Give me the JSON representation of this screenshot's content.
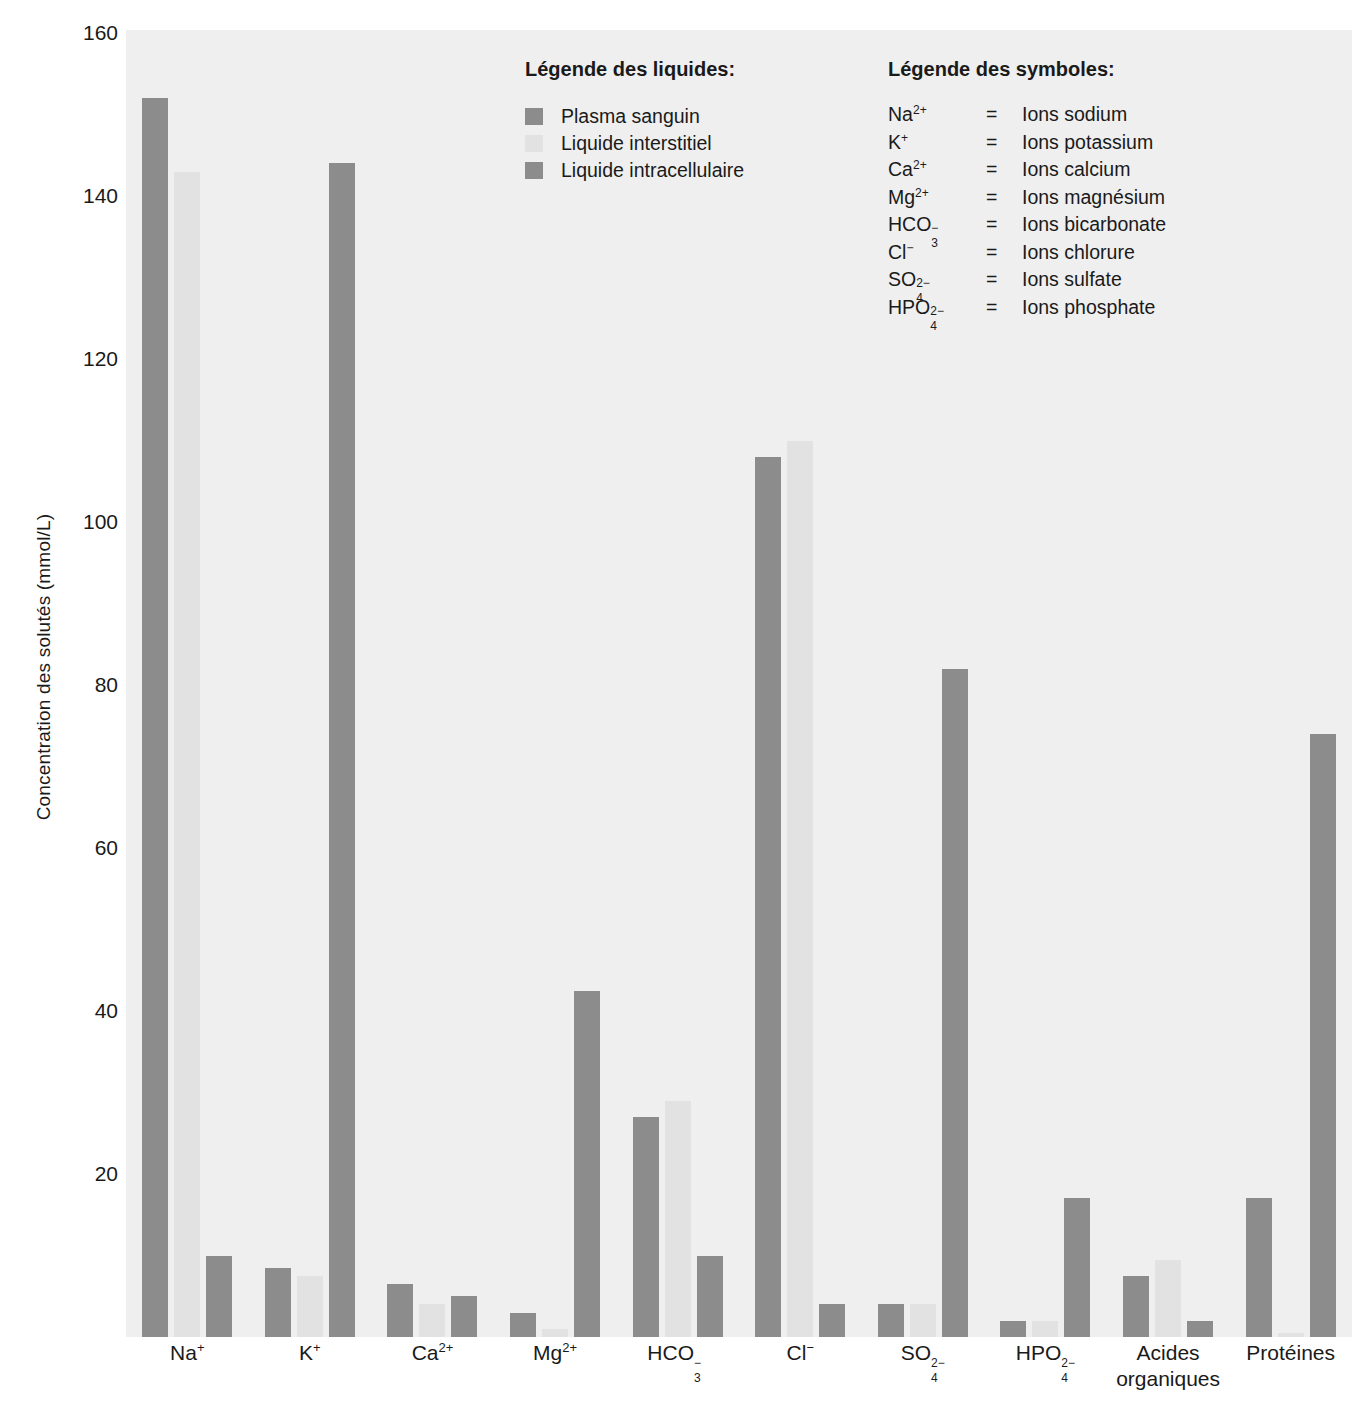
{
  "chart_data": {
    "type": "bar",
    "title": "",
    "xlabel": "",
    "ylabel": "Concentration des solutés (mmol/L)",
    "ylim": [
      0,
      160
    ],
    "yticks": [
      160,
      140,
      120,
      100,
      80,
      60,
      40,
      20
    ],
    "grid": false,
    "legend_position": "inside-top-center",
    "categories": [
      "Na+",
      "K+",
      "Ca2+",
      "Mg2+",
      "HCO3-",
      "Cl-",
      "SO4 2-",
      "HPO4 2-",
      "Acides organiques",
      "Protéines"
    ],
    "category_labels": [
      {
        "base": "Na",
        "sup": "+",
        "sub": "",
        "line2": ""
      },
      {
        "base": "K",
        "sup": "+",
        "sub": "",
        "line2": ""
      },
      {
        "base": "Ca",
        "sup": "2+",
        "sub": "",
        "line2": ""
      },
      {
        "base": "Mg",
        "sup": "2+",
        "sub": "",
        "line2": ""
      },
      {
        "base": "HCO",
        "sup": "−",
        "sub": "3",
        "line2": ""
      },
      {
        "base": "Cl",
        "sup": "−",
        "sub": "",
        "line2": ""
      },
      {
        "base": "SO",
        "sup": "2−",
        "sub": "4",
        "line2": ""
      },
      {
        "base": "HPO",
        "sup": "2−",
        "sub": "4",
        "line2": ""
      },
      {
        "base": "Acides",
        "sup": "",
        "sub": "",
        "line2": "organiques"
      },
      {
        "base": "Protéines",
        "sup": "",
        "sub": "",
        "line2": ""
      }
    ],
    "series": [
      {
        "name": "Plasma sanguin",
        "color": "#8c8c8c",
        "values": [
          152,
          8.5,
          6.5,
          3,
          27,
          108,
          4,
          2,
          7.5,
          17
        ]
      },
      {
        "name": "Liquide interstitiel",
        "color": "#e2e2e2",
        "values": [
          143,
          7.5,
          4,
          1,
          29,
          110,
          4,
          2,
          9.5,
          0.5
        ]
      },
      {
        "name": "Liquide intracellulaire",
        "color": "#8c8c8c",
        "values": [
          10,
          144,
          5,
          42.5,
          10,
          4,
          82,
          17,
          2,
          74
        ]
      }
    ]
  },
  "legend_liquides": {
    "title": "Légende des liquides:",
    "items": [
      {
        "label": "Plasma sanguin",
        "color": "#8c8c8c"
      },
      {
        "label": "Liquide interstitiel",
        "color": "#e2e2e2"
      },
      {
        "label": "Liquide intracellulaire",
        "color": "#8c8c8c"
      }
    ]
  },
  "legend_symboles": {
    "title": "Légende des symboles:",
    "equals": "=",
    "items": [
      {
        "base": "Na",
        "sup": "2+",
        "sub": "",
        "name": "Ions sodium"
      },
      {
        "base": "K",
        "sup": "+",
        "sub": "",
        "name": "Ions potassium"
      },
      {
        "base": "Ca",
        "sup": "2+",
        "sub": "",
        "name": "Ions calcium"
      },
      {
        "base": "Mg",
        "sup": "2+",
        "sub": "",
        "name": "Ions magnésium"
      },
      {
        "base": "HCO",
        "sup": "−",
        "sub": "3",
        "name": "Ions bicarbonate"
      },
      {
        "base": "Cl",
        "sup": "−",
        "sub": "",
        "name": "Ions chlorure"
      },
      {
        "base": "SO",
        "sup": "2−",
        "sub": "4",
        "name": "Ions sulfate"
      },
      {
        "base": "HPO",
        "sup": "2−",
        "sub": "4",
        "name": "Ions phosphate"
      }
    ]
  },
  "colors": {
    "plot_background": "#efefef",
    "page_background": "#ffffff",
    "bar_dark": "#8c8c8c",
    "bar_light": "#e2e2e2",
    "text": "#1a1a1a"
  }
}
